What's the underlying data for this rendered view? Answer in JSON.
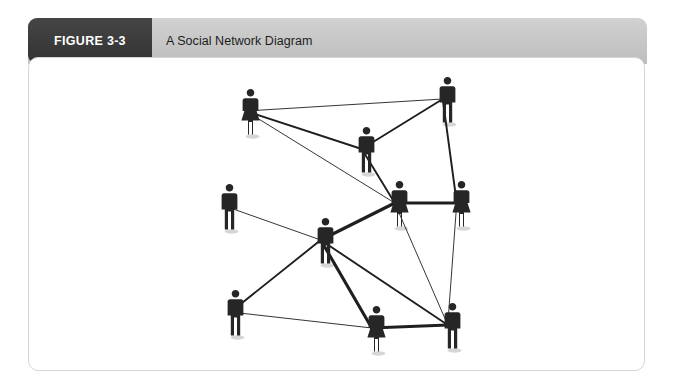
{
  "figure": {
    "tab_label": "FIGURE 3-3",
    "title": "A Social Network Diagram"
  },
  "colors": {
    "tab_background": "#3b3b3b",
    "header_band": "#c9c9c9",
    "card_background": "#ffffff",
    "card_border": "#d6d6d6",
    "node_fill": "#262626",
    "edge_stroke": "#1f1f1f"
  },
  "chart_data": {
    "type": "diagram",
    "title": "A Social Network Diagram",
    "subtype": "social-network-graph",
    "node_count": 10,
    "edge_count": 19,
    "nodes": [
      {
        "id": "n1",
        "label": "",
        "gender": "female",
        "x": 240,
        "y": 88,
        "degree": 3
      },
      {
        "id": "n2",
        "label": "",
        "gender": "male",
        "x": 437,
        "y": 76,
        "degree": 3
      },
      {
        "id": "n3",
        "label": "",
        "gender": "male",
        "x": 356,
        "y": 126,
        "degree": 4
      },
      {
        "id": "n4",
        "label": "",
        "gender": "female",
        "x": 389,
        "y": 180,
        "degree": 7
      },
      {
        "id": "n5",
        "label": "",
        "gender": "female",
        "x": 451,
        "y": 180,
        "degree": 3
      },
      {
        "id": "n6",
        "label": "",
        "gender": "male",
        "x": 219,
        "y": 183,
        "degree": 1
      },
      {
        "id": "n7",
        "label": "",
        "gender": "male",
        "x": 315,
        "y": 217,
        "degree": 6
      },
      {
        "id": "n8",
        "label": "",
        "gender": "male",
        "x": 225,
        "y": 289,
        "degree": 3
      },
      {
        "id": "n9",
        "label": "",
        "gender": "female",
        "x": 366,
        "y": 305,
        "degree": 4
      },
      {
        "id": "n10",
        "label": "",
        "gender": "male",
        "x": 442,
        "y": 302,
        "degree": 5
      }
    ],
    "edges": [
      {
        "source": "n1",
        "target": "n2",
        "weight": 1
      },
      {
        "source": "n1",
        "target": "n3",
        "weight": 2
      },
      {
        "source": "n1",
        "target": "n4",
        "weight": 1
      },
      {
        "source": "n2",
        "target": "n3",
        "weight": 2
      },
      {
        "source": "n2",
        "target": "n5",
        "weight": 2
      },
      {
        "source": "n3",
        "target": "n4",
        "weight": 2
      },
      {
        "source": "n4",
        "target": "n5",
        "weight": 3
      },
      {
        "source": "n4",
        "target": "n7",
        "weight": 3
      },
      {
        "source": "n4",
        "target": "n10",
        "weight": 1
      },
      {
        "source": "n5",
        "target": "n10",
        "weight": 1
      },
      {
        "source": "n6",
        "target": "n7",
        "weight": 1
      },
      {
        "source": "n7",
        "target": "n8",
        "weight": 2
      },
      {
        "source": "n7",
        "target": "n9",
        "weight": 3
      },
      {
        "source": "n7",
        "target": "n10",
        "weight": 2
      },
      {
        "source": "n8",
        "target": "n9",
        "weight": 1
      },
      {
        "source": "n9",
        "target": "n10",
        "weight": 3
      }
    ],
    "xlabel": "",
    "ylabel": "",
    "legend": [],
    "grid": false
  }
}
